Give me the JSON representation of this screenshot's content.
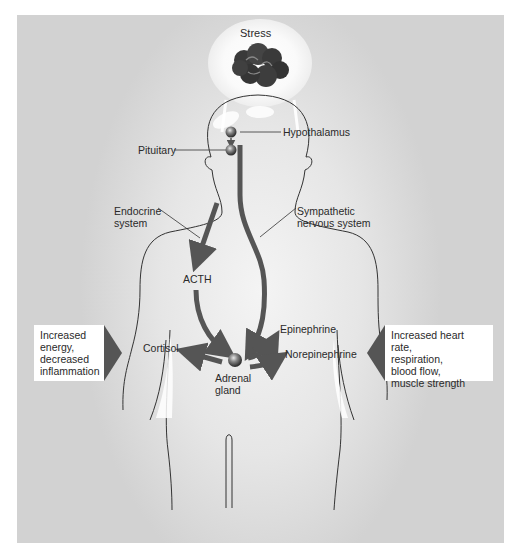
{
  "diagram": {
    "stress_label": "Stress",
    "labels": {
      "hypothalamus": "Hypothalamus",
      "pituitary": "Pituitary",
      "endocrine": "Endocrine\nsystem",
      "sympathetic": "Sympathetic\nnervous system",
      "acth": "ACTH",
      "cortisol": "Cortisol",
      "epinephrine": "Epinephrine",
      "norepinephrine": "Norepinephrine",
      "adrenal": "Adrenal\ngland"
    },
    "effect_boxes": {
      "left": "Increased\nenergy,\ndecreased\ninflammation",
      "right": "Increased heart rate,\nrespiration,\nblood flow,\nmuscle strength"
    },
    "colors": {
      "arrow": "#555555",
      "outline": "#333333",
      "panel": "#e0e0e0",
      "pointer": "#555555"
    }
  }
}
